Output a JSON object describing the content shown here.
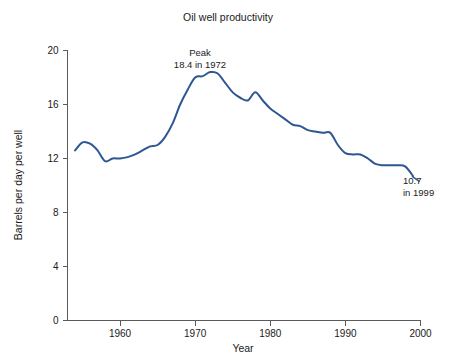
{
  "chart_data": {
    "type": "line",
    "title": "Oil well productivity",
    "xlabel": "Year",
    "ylabel": "Barrels per day per well",
    "xlim": [
      1953,
      2000
    ],
    "ylim": [
      0,
      20
    ],
    "xticks": [
      1960,
      1970,
      1980,
      1990,
      2000
    ],
    "xtick_labels": [
      "1960",
      "1970",
      "1980",
      "1990",
      "2000"
    ],
    "yticks": [
      0,
      4,
      8,
      12,
      16,
      20
    ],
    "ytick_labels": [
      "0",
      "4",
      "8",
      "12",
      "16",
      "20"
    ],
    "grid": false,
    "legend": false,
    "line_color": "#2d5693",
    "series": [
      {
        "name": "Barrels per day per well",
        "x": [
          1954,
          1955,
          1956,
          1957,
          1958,
          1959,
          1960,
          1961,
          1962,
          1963,
          1964,
          1965,
          1966,
          1967,
          1968,
          1969,
          1970,
          1971,
          1972,
          1973,
          1974,
          1975,
          1976,
          1977,
          1978,
          1979,
          1980,
          1981,
          1982,
          1983,
          1984,
          1985,
          1986,
          1987,
          1988,
          1989,
          1990,
          1991,
          1992,
          1993,
          1994,
          1995,
          1996,
          1997,
          1998,
          1999
        ],
        "values": [
          12.6,
          13.2,
          13.1,
          12.6,
          11.8,
          12.0,
          12.0,
          12.1,
          12.3,
          12.6,
          12.9,
          13.0,
          13.6,
          14.6,
          16.0,
          17.1,
          18.0,
          18.1,
          18.4,
          18.3,
          17.6,
          16.9,
          16.5,
          16.3,
          16.9,
          16.3,
          15.7,
          15.3,
          14.9,
          14.5,
          14.4,
          14.1,
          14.0,
          13.9,
          13.9,
          13.0,
          12.4,
          12.3,
          12.3,
          12.0,
          11.6,
          11.5,
          11.5,
          11.5,
          11.4,
          10.7
        ]
      }
    ],
    "annotations": [
      {
        "id": "peak",
        "lines": [
          "Peak",
          "18.4 in 1972"
        ],
        "value": 18.4,
        "year": 1972
      },
      {
        "id": "end",
        "lines": [
          "10.7",
          "in 1999"
        ],
        "value": 10.7,
        "year": 1999
      }
    ]
  }
}
